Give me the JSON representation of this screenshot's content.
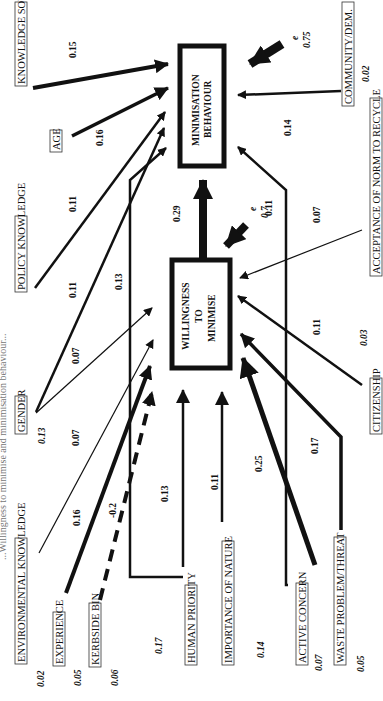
{
  "title_partial": "...Willingness to minimise and minimisation behaviour...",
  "outcomes": {
    "behaviour": {
      "line1": "MINIMISATION",
      "line2": "BEHAVIOUR",
      "error_label": "e",
      "error_value": "0.75"
    },
    "willingness": {
      "line1": "WILLINGNESS",
      "line2": "TO",
      "line3": "MINIMISE",
      "error_label": "e",
      "error_value": "0.7"
    }
  },
  "predictors": {
    "knowledge_sources": {
      "label": "KNOWLEDGE SOURCES",
      "r2": ""
    },
    "age": {
      "label": "AGE",
      "r2": ""
    },
    "policy_knowledge": {
      "label": "POLICY KNOWLEDGE",
      "r2": ""
    },
    "gender": {
      "label": "GENDER",
      "r2": "0.13"
    },
    "environmental_knowledge": {
      "label": "ENVIRONMENTAL KNOWLEDGE",
      "r2": "0.02"
    },
    "experience": {
      "label": "EXPERIENCE",
      "r2": "0.05"
    },
    "kerbside_bin": {
      "label": "KERBSIDE BIN",
      "r2": "0.06"
    },
    "human_priority": {
      "label": "HUMAN PRIORITY",
      "r2": "0.17"
    },
    "importance_of_nature": {
      "label": "IMPORTANCE OF NATURE",
      "r2": "0.14"
    },
    "active_concern": {
      "label": "ACTIVE CONCERN",
      "r2": "0.07"
    },
    "waste_problem": {
      "label": "WASTE PROBLEM/THREAT",
      "r2": "0.05"
    },
    "community": {
      "label": "COMMUNITY/DEM.",
      "r2": "0.02"
    },
    "acceptance_norm": {
      "label": "ACCEPTANCE OF NORM TO RECYCLE",
      "r2": ""
    },
    "citizenship": {
      "label": "CITIZENSHIP",
      "r2": "0.03"
    }
  },
  "paths": {
    "knowledge_sources_to_behaviour": "0.15",
    "age_to_behaviour": "0.16",
    "policy_knowledge_to_behaviour": "0.11",
    "gender_to_behaviour": "0.11",
    "gender_to_willingness": "0.07",
    "env_knowledge_to_willingness": "0.07",
    "experience_to_willingness": "0.16",
    "kerbside_to_willingness": "-0.2",
    "human_priority_to_behaviour": "0.13",
    "human_priority_to_willingness": "0.13",
    "nature_to_willingness": "0.11",
    "active_concern_to_willingness": "0.25",
    "active_concern_to_behaviour": "0.11",
    "waste_to_willingness": "0.17",
    "citizenship_to_willingness": "0.11",
    "acceptance_to_willingness": "0.07",
    "community_to_behaviour": "0.14",
    "willingness_to_behaviour": "0.29"
  }
}
